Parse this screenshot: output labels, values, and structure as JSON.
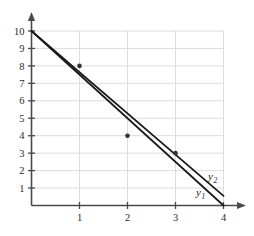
{
  "chart_data": {
    "type": "line",
    "title": "",
    "xlabel": "",
    "ylabel": "",
    "xlim": [
      0,
      4.25
    ],
    "ylim": [
      0,
      10.6
    ],
    "grid": true,
    "legend_position": "inline-right",
    "x_ticks": [
      "1",
      "2",
      "3",
      "4"
    ],
    "x_tick_values": [
      1,
      2,
      3,
      4
    ],
    "y_ticks": [
      "1",
      "2",
      "3",
      "4",
      "5",
      "6",
      "7",
      "8",
      "9",
      "10"
    ],
    "y_tick_values": [
      1,
      2,
      3,
      4,
      5,
      6,
      7,
      8,
      9,
      10
    ],
    "series": [
      {
        "name": "y1",
        "label": "y",
        "subscript": "1",
        "points": [
          [
            0,
            10
          ],
          [
            4,
            0
          ]
        ],
        "color": "#1a1a1a"
      },
      {
        "name": "y2",
        "label": "y",
        "subscript": "2",
        "points": [
          [
            0,
            10
          ],
          [
            4,
            0.55
          ]
        ],
        "color": "#1a1a1a"
      }
    ],
    "scatter_points": [
      {
        "x": 1,
        "y": 8
      },
      {
        "x": 2,
        "y": 4
      },
      {
        "x": 3,
        "y": 3
      }
    ],
    "scatter_color": "#333333",
    "grid_color": "#dcdcdc",
    "axis_color": "#4a4a4a",
    "background": "#ffffff"
  }
}
